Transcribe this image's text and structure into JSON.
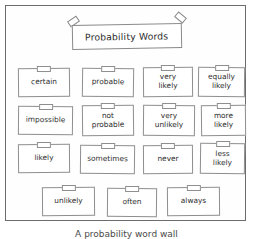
{
  "poster": {
    "title": "Probability Words",
    "tape_left": "tape-piece",
    "tape_right": "tape-piece"
  },
  "cards": [
    {
      "label": "certain",
      "x": 12,
      "y": 62,
      "w": 52,
      "h": 29,
      "rot": -0.6
    },
    {
      "label": "probable",
      "x": 76,
      "y": 62,
      "w": 52,
      "h": 29,
      "rot": 0.8
    },
    {
      "label": "very\nlikely",
      "x": 137,
      "y": 61,
      "w": 50,
      "h": 30,
      "rot": -0.5
    },
    {
      "label": "equally\nlikely",
      "x": 192,
      "y": 61,
      "w": 47,
      "h": 30,
      "rot": 0.6
    },
    {
      "label": "impossible",
      "x": 12,
      "y": 100,
      "w": 55,
      "h": 29,
      "rot": 0.5
    },
    {
      "label": "not\nprobable",
      "x": 76,
      "y": 99,
      "w": 52,
      "h": 31,
      "rot": -0.7
    },
    {
      "label": "very\nunlikely",
      "x": 137,
      "y": 99,
      "w": 52,
      "h": 31,
      "rot": 0.5
    },
    {
      "label": "more\nlikely",
      "x": 195,
      "y": 99,
      "w": 45,
      "h": 31,
      "rot": -0.6
    },
    {
      "label": "likely",
      "x": 12,
      "y": 138,
      "w": 52,
      "h": 29,
      "rot": -0.5
    },
    {
      "label": "sometimes",
      "x": 74,
      "y": 139,
      "w": 55,
      "h": 29,
      "rot": 0.6
    },
    {
      "label": "never",
      "x": 137,
      "y": 139,
      "w": 50,
      "h": 29,
      "rot": -0.4
    },
    {
      "label": "less\nlikely",
      "x": 194,
      "y": 137,
      "w": 45,
      "h": 31,
      "rot": 0.7
    },
    {
      "label": "unlikely",
      "x": 36,
      "y": 181,
      "w": 53,
      "h": 29,
      "rot": -0.5
    },
    {
      "label": "often",
      "x": 101,
      "y": 182,
      "w": 50,
      "h": 29,
      "rot": 0.6
    },
    {
      "label": "always",
      "x": 161,
      "y": 181,
      "w": 53,
      "h": 29,
      "rot": -0.5
    }
  ],
  "caption": "A probability word wall"
}
